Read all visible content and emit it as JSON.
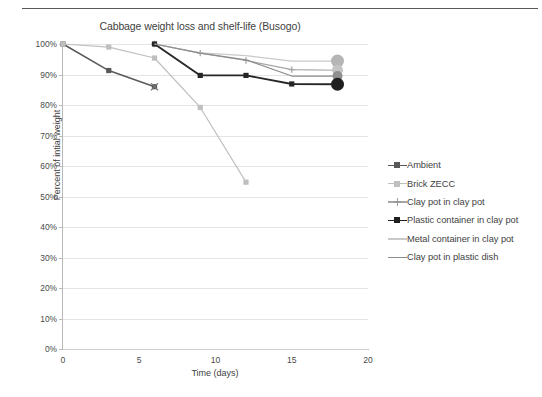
{
  "chart_data": {
    "type": "line",
    "title": "Cabbage weight loss and shelf-life (Busogo)",
    "xlabel": "Time (days)",
    "ylabel": "Percent of intial weight",
    "xlim": [
      0,
      20
    ],
    "ylim": [
      0,
      100
    ],
    "xticks": [
      "0",
      "5",
      "10",
      "15",
      "20"
    ],
    "xtick_values": [
      0,
      5,
      10,
      15,
      20
    ],
    "yticks": [
      "0%",
      "10%",
      "20%",
      "30%",
      "40%",
      "50%",
      "60%",
      "70%",
      "80%",
      "90%",
      "100%"
    ],
    "ytick_values": [
      0,
      10,
      20,
      30,
      40,
      50,
      60,
      70,
      80,
      90,
      100
    ],
    "grid": true,
    "legend_position": "right",
    "series": [
      {
        "name": "Ambient",
        "color": "#595959",
        "marker": "square",
        "x": [
          0,
          3,
          6
        ],
        "values": [
          100,
          91.3,
          86.0
        ]
      },
      {
        "name": "Brick ZECC",
        "color": "#bfbfbf",
        "marker": "square",
        "x": [
          0,
          3,
          6,
          9,
          12
        ],
        "values": [
          100,
          99.0,
          95.4,
          79.2,
          54.7
        ]
      },
      {
        "name": "Clay pot in clay pot",
        "color": "#a6a6a6",
        "marker": "plus",
        "x": [
          6,
          9,
          12,
          15,
          18
        ],
        "values": [
          100,
          97.0,
          94.6,
          91.6,
          91.4
        ]
      },
      {
        "name": "Plastic container in clay pot",
        "color": "#262626",
        "marker": "square",
        "x": [
          6,
          9,
          12,
          15,
          18
        ],
        "values": [
          100,
          89.7,
          89.7,
          86.9,
          86.8
        ]
      },
      {
        "name": "Metal container in clay pot",
        "color": "#c9c9c9",
        "marker": "none",
        "x": [
          6,
          9,
          12,
          15,
          18
        ],
        "values": [
          100,
          97.1,
          96.2,
          94.4,
          94.4
        ]
      },
      {
        "name": "Clay pot in plastic dish",
        "color": "#8c8c8c",
        "marker": "none",
        "x": [
          6,
          9,
          12,
          15,
          18
        ],
        "values": [
          100,
          97.0,
          94.8,
          89.5,
          89.5
        ]
      }
    ],
    "endpoint_markers": [
      {
        "series": "Metal container in clay pot",
        "x": 18,
        "value": 94.4,
        "color": "#b5b5b5",
        "radius": 6.5
      },
      {
        "series": "Clay pot in clay pot",
        "x": 18,
        "value": 91.4,
        "color": "#c4c4c4",
        "radius": 5.5
      },
      {
        "series": "Clay pot in plastic dish",
        "x": 18,
        "value": 89.5,
        "color": "#8f8f8f",
        "radius": 5.0
      },
      {
        "series": "Plastic container in clay pot",
        "x": 18,
        "value": 86.8,
        "color": "#1f1f1f",
        "radius": 6.5
      }
    ]
  },
  "legend": {
    "items": [
      {
        "label": "Ambient",
        "color": "#595959",
        "marker": "square"
      },
      {
        "label": "Brick ZECC",
        "color": "#bfbfbf",
        "marker": "square"
      },
      {
        "label": "Clay pot in clay pot",
        "color": "#a6a6a6",
        "marker": "plus"
      },
      {
        "label": "Plastic container in clay pot",
        "color": "#1f1f1f",
        "marker": "square"
      },
      {
        "label": "Metal container in clay pot",
        "color": "#c9c9c9",
        "marker": "none"
      },
      {
        "label": "Clay pot in plastic dish",
        "color": "#8c8c8c",
        "marker": "none"
      }
    ]
  }
}
